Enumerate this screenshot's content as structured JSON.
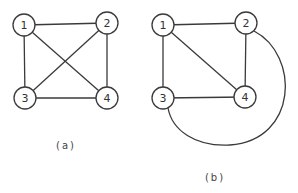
{
  "figures": [
    {
      "id": "a",
      "caption": "(a)",
      "nodes": [
        {
          "id": "1",
          "label": "1"
        },
        {
          "id": "2",
          "label": "2"
        },
        {
          "id": "3",
          "label": "3"
        },
        {
          "id": "4",
          "label": "4"
        }
      ],
      "edges": [
        [
          "1",
          "2"
        ],
        [
          "1",
          "3"
        ],
        [
          "1",
          "4"
        ],
        [
          "2",
          "3"
        ],
        [
          "2",
          "4"
        ],
        [
          "3",
          "4"
        ]
      ]
    },
    {
      "id": "b",
      "caption": "(b)",
      "nodes": [
        {
          "id": "1",
          "label": "1"
        },
        {
          "id": "2",
          "label": "2"
        },
        {
          "id": "3",
          "label": "3"
        },
        {
          "id": "4",
          "label": "4"
        }
      ],
      "edges": [
        [
          "1",
          "2"
        ],
        [
          "1",
          "3"
        ],
        [
          "1",
          "4"
        ],
        [
          "2",
          "4"
        ],
        [
          "3",
          "4"
        ],
        [
          "2",
          "3",
          "curved-outer-arc"
        ]
      ]
    }
  ],
  "colors": {
    "stroke": "#3a3a3a",
    "background": "#ffffff"
  }
}
